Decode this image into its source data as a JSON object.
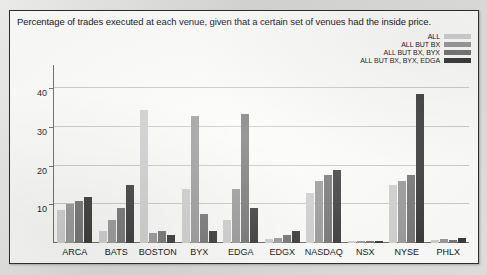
{
  "chart_data": {
    "type": "bar",
    "title": "Percentage of trades executed at each venue, given that a certain set of venues had the inside price.",
    "xlabel": "",
    "ylabel": "",
    "ylim": [
      0,
      44
    ],
    "grid": true,
    "legend_position": "top-right",
    "yticks": [
      10,
      20,
      30,
      40
    ],
    "categories": [
      "ARCA",
      "BATS",
      "BOSTON",
      "BYX",
      "EDGA",
      "EDGX",
      "NASDAQ",
      "NSX",
      "NYSE",
      "PHLX"
    ],
    "series": [
      {
        "name": "ALL",
        "color": "#cfcfcf",
        "values": [
          8.5,
          3.0,
          34.5,
          14.0,
          6.0,
          1.0,
          13.0,
          0.5,
          15.0,
          0.7
        ]
      },
      {
        "name": "ALL BUT BX",
        "color": "#9a9a9a",
        "values": [
          10.0,
          6.0,
          2.5,
          33.0,
          14.0,
          1.3,
          16.0,
          0.6,
          16.0,
          1.0
        ]
      },
      {
        "name": "ALL BUT BX, BYX",
        "color": "#767676",
        "values": [
          11.0,
          9.0,
          3.0,
          7.5,
          33.5,
          2.0,
          17.5,
          0.6,
          17.5,
          0.8
        ]
      },
      {
        "name": "ALL BUT BX, BYX, EDGA",
        "color": "#3c3c3c",
        "values": [
          12.0,
          15.0,
          2.0,
          3.0,
          9.0,
          3.0,
          19.0,
          0.6,
          38.5,
          1.4
        ]
      }
    ]
  }
}
